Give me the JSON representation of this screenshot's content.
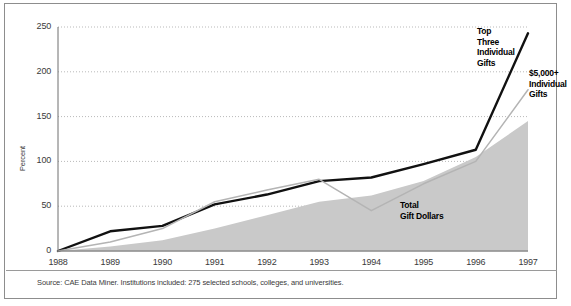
{
  "chart_data": {
    "type": "line",
    "title": "",
    "xlabel": "",
    "ylabel": "Percent",
    "categories": [
      "1988",
      "1989",
      "1990",
      "1991",
      "1992",
      "1993",
      "1994",
      "1995",
      "1996",
      "1997"
    ],
    "x": [
      1988,
      1989,
      1990,
      1991,
      1992,
      1993,
      1994,
      1995,
      1996,
      1997
    ],
    "ylim": [
      0,
      250
    ],
    "yticks": [
      0,
      50,
      100,
      150,
      200,
      250
    ],
    "grid": true,
    "legend_position": "inline-annotations",
    "series": [
      {
        "name": "Top Three Individual Gifts",
        "render": "line",
        "color": "#111111",
        "values": [
          0,
          22,
          28,
          52,
          63,
          78,
          82,
          97,
          113,
          243
        ]
      },
      {
        "name": "$5,000+ Individual Gifts",
        "render": "line",
        "color": "#b4b4b4",
        "values": [
          0,
          10,
          25,
          55,
          68,
          80,
          45,
          75,
          100,
          180
        ]
      },
      {
        "name": "Total Gift Dollars",
        "render": "area",
        "color": "#c9c9c9",
        "values": [
          0,
          5,
          12,
          25,
          40,
          55,
          62,
          78,
          105,
          145
        ]
      }
    ],
    "annotations": [
      {
        "id": "top-three",
        "text": "Top Three Individual Gifts"
      },
      {
        "id": "five-thousand",
        "text": "$5,000+ Individual Gifts"
      },
      {
        "id": "total",
        "text": "Total Gift Dollars"
      }
    ]
  },
  "axis": {
    "y_label": "Percent",
    "y_ticks": [
      "250",
      "200",
      "150",
      "100",
      "50",
      "0"
    ],
    "x_ticks": [
      "1988",
      "1989",
      "1990",
      "1991",
      "1992",
      "1993",
      "1994",
      "1995",
      "1996",
      "1997"
    ]
  },
  "annotations": {
    "top_three": {
      "line1": "Top",
      "line2": "Three",
      "line3": "Individual",
      "line4": "Gifts"
    },
    "five_thousand": {
      "line1": "$5,000+",
      "line2": "Individual",
      "line3": "Gifts"
    },
    "total_gift": {
      "line1": "Total",
      "line2": "Gift Dollars"
    }
  },
  "footer": {
    "source": "Source: CAE Data Miner. Institutions included: 275 selected schools, colleges, and universities."
  },
  "colors": {
    "line_black": "#111111",
    "line_gray": "#b4b4b4",
    "area_gray": "#c9c9c9",
    "grid": "#b9b9b9",
    "border": "#8d8d8d",
    "text": "#3a3a3a"
  }
}
